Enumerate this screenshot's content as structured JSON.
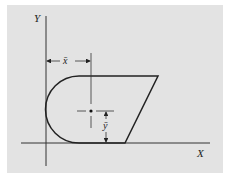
{
  "diagram": {
    "type": "centroid-figure",
    "axes": {
      "y_label": "Y",
      "x_label": "X"
    },
    "dimensions": {
      "x_bar": "x̄",
      "y_bar": "ȳ"
    },
    "shape": "half-disk joined to trapezoid",
    "colors": {
      "background": "#e3e3e3",
      "stroke": "#222222"
    }
  }
}
